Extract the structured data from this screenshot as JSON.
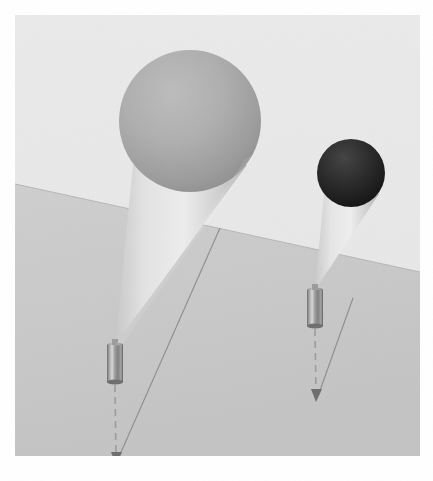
{
  "meta": {
    "canvas_width": 433,
    "canvas_height": 481,
    "margin": 15
  },
  "palette": {
    "page_background": "#ffffff",
    "sky_background": "#e9e9e9",
    "ground_near": "#c9c9c9",
    "ground_far": "#d6d6d6",
    "horizon_line": "#b4b4b4",
    "large_sphere_light": "#b3b3b3",
    "large_sphere_dark": "#9a9a9a",
    "small_sphere_light": "#3a3a3a",
    "small_sphere_dark": "#1b1b1b",
    "cone_light": "#e2e2e2",
    "cone_dark": "#b9b9b9",
    "cylinder_light": "#d2d2d2",
    "cylinder_mid": "#8f8f8f",
    "cylinder_dark": "#5d5d5d",
    "tether_line": "#8c8c8c",
    "dashed_line": "#9a9a9a",
    "arrow_head": "#6e6e6e"
  },
  "scene": {
    "background_label": "sky-background",
    "ground_label": "ground-plane",
    "horizon": {
      "left_x": 0,
      "left_y": 169,
      "right_x": 405,
      "right_y": 257
    }
  },
  "objects": [
    {
      "id": "balloon-large",
      "label": "large gray balloon",
      "sphere": {
        "center_x": 175,
        "center_y": 106,
        "radius": 71,
        "fill_light": "#b6b6b6",
        "fill_dark": "#969696"
      },
      "cone": {
        "apex_x": 100,
        "apex_y": 330,
        "left_x": 118,
        "left_y": 150,
        "right_x": 232,
        "right_y": 150,
        "fill_light": "#e4e4e4",
        "fill_dark": "#bcbcbc"
      },
      "cylinder": {
        "x": 92,
        "y": 330,
        "width": 16,
        "height": 37,
        "label": "metallic weight"
      },
      "plumb_line": {
        "from_x": 100,
        "from_y": 370,
        "to_x": 101,
        "to_y": 445,
        "style": "dashed"
      },
      "tether_line": {
        "from_x": 205,
        "from_y": 213,
        "to_x": 103,
        "to_y": 447,
        "style": "solid"
      },
      "arrow_tip": {
        "x": 101,
        "y": 448
      }
    },
    {
      "id": "balloon-small",
      "label": "small dark balloon",
      "sphere": {
        "center_x": 336,
        "center_y": 158,
        "radius": 34,
        "fill_light": "#3d3d3d",
        "fill_dark": "#141414"
      },
      "cone": {
        "apex_x": 300,
        "apex_y": 275,
        "left_x": 309,
        "left_y": 179,
        "right_x": 364,
        "right_y": 179,
        "fill_light": "#e4e4e4",
        "fill_dark": "#bcbcbc"
      },
      "cylinder": {
        "x": 292,
        "y": 275,
        "width": 16,
        "height": 36,
        "label": "metallic weight"
      },
      "plumb_line": {
        "from_x": 300,
        "from_y": 314,
        "to_x": 301,
        "to_y": 382,
        "style": "dashed"
      },
      "tether_line": {
        "from_x": 338,
        "from_y": 283,
        "to_x": 303,
        "to_y": 384,
        "style": "solid"
      },
      "arrow_tip": {
        "x": 301,
        "y": 385
      }
    }
  ],
  "chart_data": {
    "type": "scatter",
    "xlabel": "",
    "ylabel": "",
    "series": [
      {
        "name": "balloon-large",
        "sphere_center": [
          175,
          106
        ],
        "sphere_radius": 71,
        "anchor": [
          100,
          330
        ],
        "arrow_tip": [
          101,
          448
        ]
      },
      {
        "name": "balloon-small",
        "sphere_center": [
          336,
          158
        ],
        "sphere_radius": 34,
        "anchor": [
          300,
          275
        ],
        "arrow_tip": [
          301,
          385
        ]
      }
    ]
  }
}
